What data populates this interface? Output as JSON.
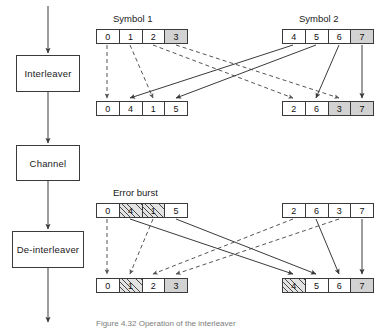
{
  "figure": {
    "caption": "Figure 4.32  Operation of the interleaver"
  },
  "pipeline": {
    "blocks": [
      {
        "id": "interleaver",
        "label": "Interleaver"
      },
      {
        "id": "channel",
        "label": "Channel"
      },
      {
        "id": "de-interleaver",
        "label": "De-interleaver"
      }
    ]
  },
  "labels": {
    "symbol1": "Symbol 1",
    "symbol2": "Symbol 2",
    "error_burst": "Error burst"
  },
  "colors": {
    "stroke": "#3a3a3a",
    "text": "#1a1a1a",
    "shaded_cell": "#d2d2d2",
    "hatch_line": "#4a4a4a",
    "hatch_bg": "#e3e3e3",
    "caption": "#7d7d7d"
  },
  "registers": {
    "row1_left": {
      "name": "symbol-1-input",
      "cells": [
        {
          "value": "0",
          "fill": "plain"
        },
        {
          "value": "1",
          "fill": "plain"
        },
        {
          "value": "2",
          "fill": "plain"
        },
        {
          "value": "3",
          "fill": "shaded"
        }
      ]
    },
    "row1_right": {
      "name": "symbol-2-input",
      "cells": [
        {
          "value": "4",
          "fill": "plain"
        },
        {
          "value": "5",
          "fill": "plain"
        },
        {
          "value": "6",
          "fill": "plain"
        },
        {
          "value": "7",
          "fill": "shaded"
        }
      ]
    },
    "row2_left": {
      "name": "interleaved-block-1",
      "cells": [
        {
          "value": "0",
          "fill": "plain"
        },
        {
          "value": "4",
          "fill": "plain"
        },
        {
          "value": "1",
          "fill": "plain"
        },
        {
          "value": "5",
          "fill": "plain"
        }
      ]
    },
    "row2_right": {
      "name": "interleaved-block-2",
      "cells": [
        {
          "value": "2",
          "fill": "plain"
        },
        {
          "value": "6",
          "fill": "plain"
        },
        {
          "value": "3",
          "fill": "shaded"
        },
        {
          "value": "7",
          "fill": "shaded"
        }
      ]
    },
    "row3_left": {
      "name": "channel-output-block-1",
      "cells": [
        {
          "value": "0",
          "fill": "plain"
        },
        {
          "value": "4",
          "fill": "hatched"
        },
        {
          "value": "1",
          "fill": "hatched"
        },
        {
          "value": "5",
          "fill": "plain"
        }
      ]
    },
    "row3_right": {
      "name": "channel-output-block-2",
      "cells": [
        {
          "value": "2",
          "fill": "plain"
        },
        {
          "value": "6",
          "fill": "plain"
        },
        {
          "value": "3",
          "fill": "plain"
        },
        {
          "value": "7",
          "fill": "plain"
        }
      ]
    },
    "row4_left": {
      "name": "symbol-1-output",
      "cells": [
        {
          "value": "0",
          "fill": "plain"
        },
        {
          "value": "1",
          "fill": "hatched"
        },
        {
          "value": "2",
          "fill": "plain"
        },
        {
          "value": "3",
          "fill": "shaded"
        }
      ]
    },
    "row4_right": {
      "name": "symbol-2-output",
      "cells": [
        {
          "value": "4",
          "fill": "hatched"
        },
        {
          "value": "5",
          "fill": "plain"
        },
        {
          "value": "6",
          "fill": "plain"
        },
        {
          "value": "7",
          "fill": "shaded"
        }
      ]
    }
  }
}
